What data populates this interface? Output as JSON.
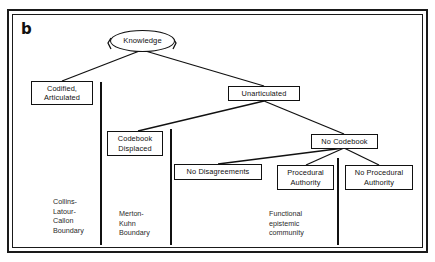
{
  "figure": {
    "panel_letter": "b",
    "type": "hierarchical-tree-diagram"
  },
  "nodes": {
    "knowledge": {
      "label": "Knowledge",
      "shape": "ellipse"
    },
    "codified": {
      "label": "Codified,\nArticulated",
      "shape": "rectangle"
    },
    "unarticulated": {
      "label": "Unarticulated",
      "shape": "rectangle"
    },
    "codebook_displaced": {
      "label": "Codebook\nDisplaced",
      "shape": "rectangle"
    },
    "no_codebook": {
      "label": "No Codebook",
      "shape": "rectangle"
    },
    "no_disagreements": {
      "label": "No Disagreements",
      "shape": "rectangle"
    },
    "procedural_authority": {
      "label": "Procedural\nAuthority",
      "shape": "rectangle"
    },
    "no_procedural_authority": {
      "label": "No Procedural\nAuthority",
      "shape": "rectangle"
    }
  },
  "boundaries": [
    {
      "id": "collins-latour-callon",
      "label": "Collins-\nLatour-\nCallon\nBoundary"
    },
    {
      "id": "merton-kuhn",
      "label": "Merton-\nKuhn\nBoundary"
    },
    {
      "id": "functional-epistemic-community",
      "label": "Functional\nepistemic\ncommunity"
    }
  ],
  "edges": [
    {
      "from": "knowledge",
      "to": "codified"
    },
    {
      "from": "knowledge",
      "to": "unarticulated"
    },
    {
      "from": "unarticulated",
      "to": "codebook_displaced"
    },
    {
      "from": "unarticulated",
      "to": "no_codebook"
    },
    {
      "from": "no_codebook",
      "to": "no_disagreements"
    },
    {
      "from": "no_codebook",
      "to": "procedural_authority"
    },
    {
      "from": "no_codebook",
      "to": "no_procedural_authority"
    }
  ],
  "colors": {
    "stroke": "#111111",
    "background": "#ffffff",
    "text": "#111111"
  }
}
